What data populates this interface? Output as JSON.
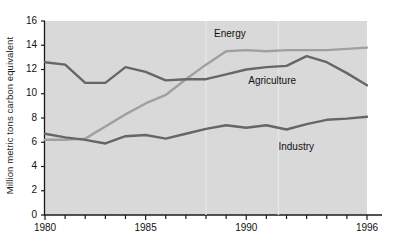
{
  "chart_data": {
    "type": "line",
    "title": "",
    "xlabel": "",
    "ylabel": "Million metric tons carbon equivalent",
    "xlim": [
      1980,
      1996
    ],
    "ylim": [
      0,
      16
    ],
    "ytick_labels": [
      "16",
      "14",
      "12",
      "10",
      "8",
      "6",
      "4",
      "2",
      "0"
    ],
    "ytick_values": [
      16,
      14,
      12,
      10,
      8,
      6,
      4,
      2,
      0
    ],
    "xtick_labels": [
      "1980",
      "1985",
      "1990",
      "1996"
    ],
    "xtick_values": [
      1980,
      1985,
      1990,
      1996
    ],
    "minor_xticks_every": 1,
    "grid": false,
    "legend_position": "inline-annotations",
    "plot_background": "#d9d9d9",
    "x": [
      1980,
      1981,
      1982,
      1983,
      1984,
      1985,
      1986,
      1987,
      1988,
      1989,
      1990,
      1991,
      1992,
      1993,
      1994,
      1995,
      1996
    ],
    "series": [
      {
        "name": "Energy",
        "color": "#a0a0a0",
        "label": "Energy",
        "values": [
          6.2,
          6.2,
          6.3,
          7.3,
          8.3,
          9.2,
          9.9,
          11.2,
          12.4,
          13.5,
          13.6,
          13.5,
          13.6,
          13.6,
          13.6,
          13.7,
          13.8
        ]
      },
      {
        "name": "Agriculture",
        "color": "#666666",
        "label": "Agriculture",
        "values": [
          12.6,
          12.4,
          10.9,
          10.9,
          12.2,
          11.8,
          11.1,
          11.2,
          11.2,
          11.6,
          12.0,
          12.2,
          12.3,
          13.1,
          12.6,
          11.7,
          10.7
        ]
      },
      {
        "name": "Industry",
        "color": "#666666",
        "label": "Industry",
        "values": [
          6.7,
          6.4,
          6.2,
          5.9,
          6.5,
          6.6,
          6.3,
          6.7,
          7.1,
          7.4,
          7.2,
          7.4,
          7.05,
          7.5,
          7.85,
          7.95,
          8.1
        ]
      }
    ],
    "annotations": [
      {
        "text": "Energy",
        "x": 1988.4,
        "y": 14.85
      },
      {
        "text": "Agriculture",
        "x": 1990.1,
        "y": 11.05
      },
      {
        "text": "Industry",
        "x": 1991.6,
        "y": 5.6
      }
    ]
  }
}
